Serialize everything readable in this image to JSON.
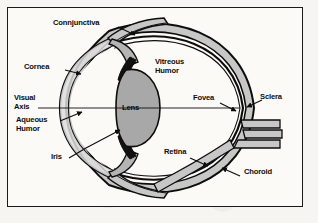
{
  "figure": {
    "type": "anatomical-diagram",
    "background_color": "#f6f5f2",
    "frame_color": "#1a1a1a",
    "ink_color": "#0d0d0d",
    "fill_light_gray": "#c9c9c9",
    "fill_mid_gray": "#a3a3a3",
    "fill_dark": "#111111",
    "labels": [
      {
        "id": "conjunctiva",
        "text": "Connjunctiva",
        "lines": [
          "Connjunctiva"
        ]
      },
      {
        "id": "cornea",
        "text": "Cornea",
        "lines": [
          "Cornea"
        ]
      },
      {
        "id": "visual-axis",
        "text": "Visual Axis",
        "lines": [
          "Visual",
          "Axis"
        ]
      },
      {
        "id": "aqueous-humor",
        "text": "Aqueous Humor",
        "lines": [
          "Aqueous",
          "Humor"
        ]
      },
      {
        "id": "iris",
        "text": "Iris",
        "lines": [
          "Iris"
        ]
      },
      {
        "id": "lens",
        "text": "Lens",
        "lines": [
          "Lens"
        ]
      },
      {
        "id": "vitreous-humor",
        "text": "Vitreous Humor",
        "lines": [
          "Vitreous",
          "Humor"
        ]
      },
      {
        "id": "fovea",
        "text": "Fovea",
        "lines": [
          "Fovea"
        ]
      },
      {
        "id": "sclera",
        "text": "Sclera",
        "lines": [
          "Sclera"
        ]
      },
      {
        "id": "retina",
        "text": "Retina",
        "lines": [
          "Retina"
        ]
      },
      {
        "id": "choroid",
        "text": "Choroid",
        "lines": [
          "Choroid"
        ]
      }
    ],
    "text": {
      "conjunctiva": "Connjunctiva",
      "cornea": "Cornea",
      "visual_axis_line1": "Visual",
      "visual_axis_line2": "Axis",
      "aqueous_line1": "Aqueous",
      "aqueous_line2": "Humor",
      "iris": "Iris",
      "lens": "Lens",
      "vitreous_line1": "Vitreous",
      "vitreous_line2": "Humor",
      "fovea": "Fovea",
      "sclera": "Sclera",
      "retina": "Retina",
      "choroid": "Choroid"
    }
  }
}
